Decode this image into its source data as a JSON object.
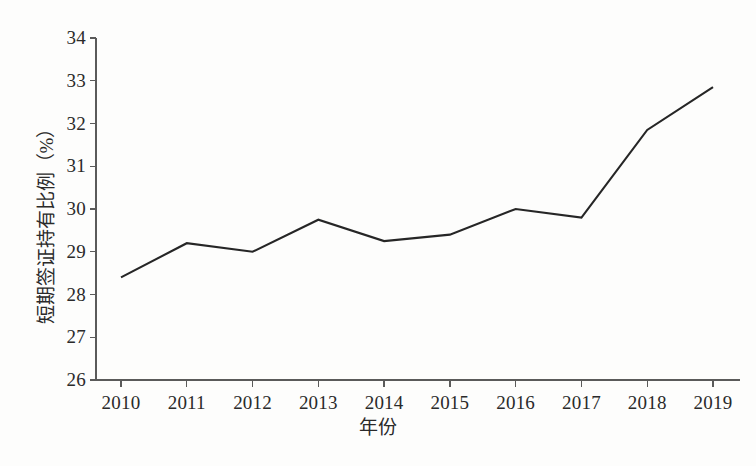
{
  "chart_data": {
    "type": "line",
    "title": "",
    "xlabel": "年份",
    "ylabel": "短期签证持有比例（%）",
    "categories": [
      "2010",
      "2011",
      "2012",
      "2013",
      "2014",
      "2015",
      "2016",
      "2017",
      "2018",
      "2019"
    ],
    "x": [
      2010,
      2011,
      2012,
      2013,
      2014,
      2015,
      2016,
      2017,
      2018,
      2019
    ],
    "series": [
      {
        "name": "短期签证持有比例",
        "values": [
          28.4,
          29.2,
          29.0,
          29.75,
          29.25,
          29.4,
          30.0,
          29.8,
          31.85,
          32.85
        ]
      }
    ],
    "values": [
      28.4,
      29.2,
      29.0,
      29.75,
      29.25,
      29.4,
      30.0,
      29.8,
      31.85,
      32.85
    ],
    "ylim": [
      26,
      34
    ],
    "yticks": [
      26,
      27,
      28,
      29,
      30,
      31,
      32,
      33,
      34
    ],
    "ytick_labels": [
      "26",
      "27",
      "28",
      "29",
      "30",
      "31",
      "32",
      "33",
      "34"
    ],
    "xtick_labels": [
      "2010",
      "2011",
      "2012",
      "2013",
      "2014",
      "2015",
      "2016",
      "2017",
      "2018",
      "2019"
    ],
    "grid": false,
    "legend": false,
    "legend_position": "none",
    "line_color": "#262626",
    "axis_color": "#5a5a5a",
    "background_color": "#fdfdfc"
  },
  "axes": {
    "y_title": "短期签证持有比例（%）",
    "x_title": "年份"
  }
}
